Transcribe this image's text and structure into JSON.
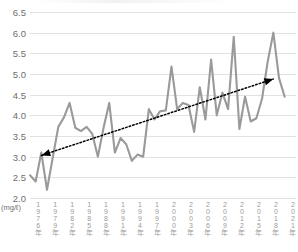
{
  "chart_data": {
    "type": "line",
    "title": "",
    "xlabel": "",
    "ylabel": "",
    "unit_label": "(mg/ℓ)",
    "ylim": [
      2.0,
      6.5
    ],
    "ytick_labels": [
      "6.5",
      "6.0",
      "5.5",
      "5.0",
      "4.5",
      "4.0",
      "3.5",
      "3.0",
      "2.5",
      "2.0"
    ],
    "ytick_values": [
      6.5,
      6.0,
      5.5,
      5.0,
      4.5,
      4.0,
      3.5,
      3.0,
      2.5,
      2.0
    ],
    "grid": true,
    "legend": "none",
    "xtick_labels": [
      "1976年",
      "1979年",
      "1982年",
      "1985年",
      "1988年",
      "1991年",
      "1994年",
      "1997年",
      "2000年",
      "2003年",
      "2006年",
      "2009年",
      "2012年",
      "2015年",
      "2018年",
      "2021年"
    ],
    "xtick_years": [
      1976,
      1979,
      1982,
      1985,
      1988,
      1991,
      1994,
      1997,
      2000,
      2003,
      2006,
      2009,
      2012,
      2015,
      2018,
      2021
    ],
    "xlim": [
      1975,
      2022
    ],
    "series": [
      {
        "name": "測定値",
        "color": "#9a9a9a",
        "x": [
          1975,
          1976,
          1977,
          1978,
          1979,
          1980,
          1981,
          1982,
          1983,
          1984,
          1985,
          1986,
          1987,
          1988,
          1989,
          1990,
          1991,
          1992,
          1993,
          1994,
          1995,
          1996,
          1997,
          1998,
          1999,
          2000,
          2001,
          2002,
          2003,
          2004,
          2005,
          2006,
          2007,
          2008,
          2009,
          2010,
          2011,
          2012,
          2013,
          2014,
          2015,
          2016,
          2017,
          2018,
          2019,
          2020,
          2021
        ],
        "values": [
          2.55,
          2.4,
          3.1,
          2.2,
          null,
          3.72,
          3.95,
          4.3,
          3.7,
          3.62,
          3.72,
          3.55,
          3.0,
          3.7,
          4.3,
          3.1,
          3.45,
          3.3,
          2.9,
          3.05,
          3.0,
          4.15,
          3.9,
          4.1,
          4.12,
          5.18,
          4.15,
          4.3,
          4.25,
          3.6,
          4.68,
          3.9,
          5.35,
          4.0,
          4.55,
          4.15,
          5.9,
          3.67,
          4.45,
          3.85,
          3.93,
          4.4,
          5.3,
          6.0,
          4.9,
          4.45,
          null
        ]
      }
    ],
    "annotations": [
      {
        "type": "trend-arrow",
        "style": "dotted double-headed",
        "color": "#000000",
        "start": {
          "year": 1977,
          "value": 3.03
        },
        "end": {
          "year": 2018,
          "value": 4.88
        }
      }
    ]
  },
  "icons": {
    "arrow_left": "arrow-left-head",
    "arrow_right": "arrow-right-head"
  }
}
